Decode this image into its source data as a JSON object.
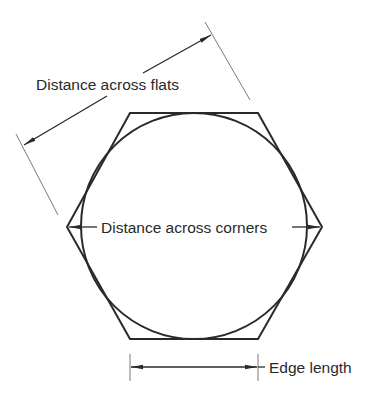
{
  "diagram": {
    "colors": {
      "stroke": "#2a2a2a",
      "extension_line": "#6a6a6a",
      "text": "#2a2a2a",
      "background": "#ffffff"
    },
    "labels": {
      "flats": "Distance across flats",
      "corners": "Distance across corners",
      "edge": "Edge length"
    },
    "shapes": {
      "hexagon": "regular hexagon (flat top and bottom)",
      "circle": "inscribed circle tangent to all six flats"
    }
  }
}
